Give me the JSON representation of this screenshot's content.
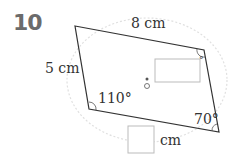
{
  "problem": {
    "number": "10"
  },
  "diagram": {
    "shape": "parallelogram",
    "labels": {
      "top_side": "8 cm",
      "left_side": "5 cm",
      "angle_bottom_left": "110°",
      "angle_bottom_right": "70°",
      "angle_top_right": "°",
      "answer_unit": "cm"
    },
    "answer_boxes": [
      {
        "position": "inside-shape",
        "purpose": "angle-answer"
      },
      {
        "position": "below-shape",
        "purpose": "length-answer"
      }
    ],
    "colors": {
      "line": "#333333",
      "dashed_circle": "#dddddd",
      "box_border": "#bbbbbb",
      "number": "#6b6b6b"
    }
  }
}
